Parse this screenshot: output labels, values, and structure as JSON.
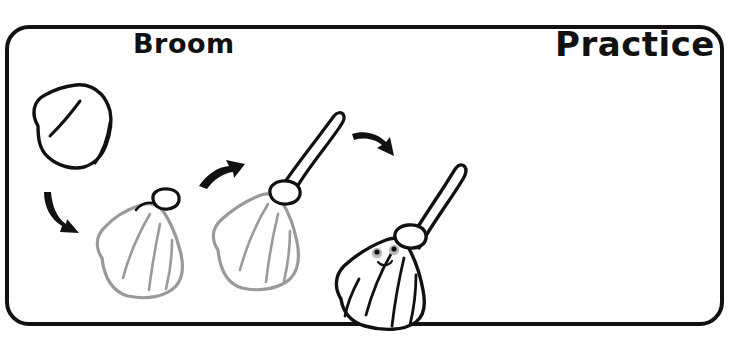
{
  "worksheet": {
    "heading_left": "Broom",
    "heading_right": "Practice",
    "frame_color": "#111111",
    "background_color": "#ffffff",
    "completed_stroke_color": "#9a9a9a",
    "new_stroke_color": "#111111"
  },
  "steps": [
    {
      "index": 1,
      "name": "bristle-blob",
      "description": "Rough bell-shaped blob outline of the broom bristles with two inner crease lines",
      "new_parts": "bristle outline",
      "stroke": "#111111"
    },
    {
      "index": 2,
      "name": "bristles-with-collar",
      "description": "Bristle shape redrawn in gray with a new black collar band added at the top",
      "new_parts": "collar band",
      "stroke": "#111111"
    },
    {
      "index": 3,
      "name": "broom-with-handle",
      "description": "Gray bristles and collar with a new black handle angled up to the right",
      "new_parts": "handle",
      "stroke": "#111111"
    },
    {
      "index": 4,
      "name": "finished-broom",
      "description": "Completed broom inked fully in black with a smiling face on the bristles",
      "new_parts": "face: two eyes, two cheeks, smile",
      "stroke": "#111111"
    }
  ],
  "arrows": [
    {
      "name": "arrow-step1-to-step2",
      "direction": "down-right"
    },
    {
      "name": "arrow-step2-to-step3",
      "direction": "up-right"
    },
    {
      "name": "arrow-step3-to-step4",
      "direction": "down-right"
    }
  ]
}
